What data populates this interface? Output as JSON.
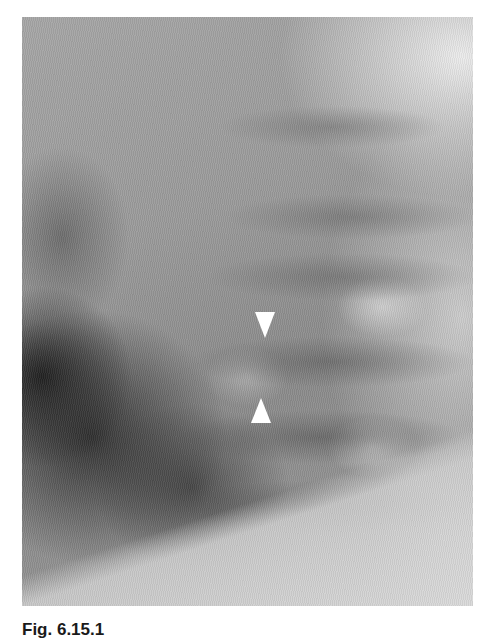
{
  "figure": {
    "type": "radiograph",
    "annotations": [
      {
        "name": "arrowhead-down",
        "direction": "down",
        "color": "#ffffff"
      },
      {
        "name": "arrowhead-up",
        "direction": "up",
        "color": "#ffffff"
      }
    ]
  },
  "caption": {
    "label": "Fig. 6.15.1"
  }
}
